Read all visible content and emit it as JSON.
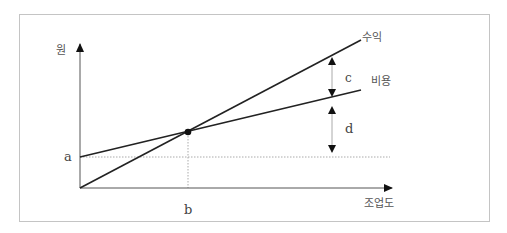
{
  "diagram": {
    "title": "",
    "y_axis_label": "원",
    "x_axis_label": "조업도",
    "lines": [
      {
        "name": "revenue",
        "label": "수익",
        "from": [
          80,
          188
        ],
        "to": [
          361,
          40
        ]
      },
      {
        "name": "cost",
        "label": "비용",
        "from": [
          80,
          157
        ],
        "to": [
          361,
          90
        ]
      }
    ],
    "intersection": {
      "x": 188,
      "y": 132
    },
    "markers": {
      "a": "a",
      "b": "b",
      "c": "c",
      "d": "d"
    },
    "colors": {
      "line": "#222222",
      "axis": "#555555",
      "guide": "#aaaaaa",
      "frame": "#c4c4c4"
    }
  }
}
